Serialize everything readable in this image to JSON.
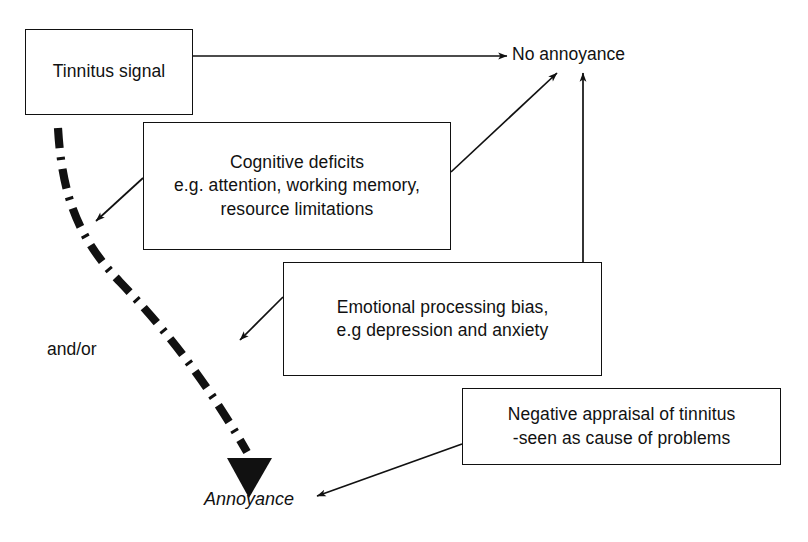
{
  "diagram": {
    "background_color": "#ffffff",
    "line_color": "#111111",
    "nodes": [
      {
        "id": "tinnitus",
        "label": "Tinnitus signal",
        "shape": "rectangle"
      },
      {
        "id": "cognitive",
        "label": "Cognitive deficits\ne.g. attention, working memory,\nresource limitations",
        "shape": "rectangle"
      },
      {
        "id": "emotional",
        "label": "Emotional processing bias,\ne.g depression and anxiety",
        "shape": "rectangle"
      },
      {
        "id": "negative",
        "label": "Negative appraisal of tinnitus\n-seen as cause of problems",
        "shape": "rectangle"
      }
    ],
    "labels": [
      {
        "id": "no-annoyance",
        "text": "No annoyance",
        "style": "plain"
      },
      {
        "id": "annoyance",
        "text": "Annoyance",
        "style": "italic"
      },
      {
        "id": "and-or",
        "text": "and/or",
        "style": "plain"
      }
    ],
    "edges": [
      {
        "id": "tinnitus-to-no-annoyance",
        "from": "tinnitus",
        "to": "no-annoyance",
        "style": "thin-solid-arrow"
      },
      {
        "id": "cognitive-to-no-annoyance",
        "from": "cognitive",
        "to": "no-annoyance",
        "style": "thin-solid-arrow"
      },
      {
        "id": "emotional-to-no-annoyance",
        "from": "emotional",
        "to": "no-annoyance",
        "style": "thin-solid-arrow"
      },
      {
        "id": "cognitive-to-path",
        "from": "cognitive",
        "to": "annoyance-path",
        "style": "thin-solid-arrow"
      },
      {
        "id": "emotional-to-path",
        "from": "emotional",
        "to": "annoyance-path",
        "style": "thin-solid-arrow"
      },
      {
        "id": "negative-to-annoyance",
        "from": "negative",
        "to": "annoyance",
        "style": "thin-solid-arrow"
      },
      {
        "id": "tinnitus-to-annoyance",
        "from": "tinnitus",
        "to": "annoyance",
        "style": "thick-dash-dot-arrow"
      }
    ]
  }
}
